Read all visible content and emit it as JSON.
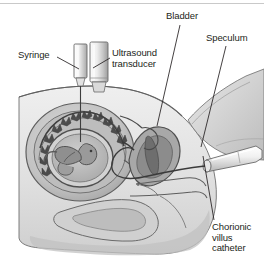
{
  "figure": {
    "width": 264,
    "height": 270,
    "background_color": "#ffffff",
    "ink_color": "#231f20",
    "rule_color": "#c9c9c9"
  },
  "labels": {
    "syringe": "Syringe",
    "ultrasound_transducer": "Ultrasound\ntransducer",
    "bladder": "Bladder",
    "speculum": "Speculum",
    "chorionic_villus_catheter": "Chorionic\nvillus\ncatheter"
  },
  "palette": {
    "skin_light": "#ededed",
    "skin_mid": "#d8d8d8",
    "tissue_mid": "#c4c4c4",
    "tissue_dark": "#a9a9a9",
    "organ_dark": "#8e8e8e",
    "organ_darker": "#767676",
    "outline": "#5a5a5a",
    "instrument_light": "#f4f4f4",
    "instrument_shade": "#bdbdbd"
  },
  "leader_lines": [
    {
      "name": "syringe-leader",
      "x1": 57,
      "y1": 57,
      "x2": 79,
      "y2": 69
    },
    {
      "name": "ultrasound-leader",
      "x1": 110,
      "y1": 58,
      "x2": 93,
      "y2": 68
    },
    {
      "name": "bladder-leader",
      "x1": 180,
      "y1": 25,
      "x2": 157,
      "y2": 126
    },
    {
      "name": "speculum-leader",
      "x1": 226,
      "y1": 46,
      "x2": 201,
      "y2": 147
    },
    {
      "name": "catheter-leader",
      "x1": 214,
      "y1": 220,
      "x2": 203,
      "y2": 156
    }
  ]
}
